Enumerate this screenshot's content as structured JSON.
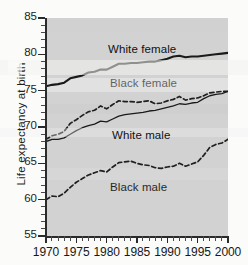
{
  "chart_data": {
    "type": "line",
    "title": "",
    "xlabel": "",
    "ylabel": "Life expectancy at birth",
    "xlim": [
      1970,
      2000
    ],
    "ylim": [
      55,
      85
    ],
    "grid": false,
    "legend_position": "inline-labels",
    "y_ticks": [
      55,
      60,
      65,
      70,
      75,
      80,
      85
    ],
    "y_tick_labels": [
      "55",
      "60",
      "65",
      "70",
      "75",
      "80",
      "85"
    ],
    "y_minor_tick_step": 1,
    "x_ticks": [
      1970,
      1975,
      1980,
      1985,
      1990,
      1995,
      2000
    ],
    "x_tick_labels": [
      "1970",
      "1975",
      "1980",
      "1985",
      "1990",
      "1995",
      "2000"
    ],
    "x_minor_tick_step": 1,
    "x": [
      1970,
      1971,
      1972,
      1973,
      1974,
      1975,
      1976,
      1977,
      1978,
      1979,
      1980,
      1981,
      1982,
      1983,
      1984,
      1985,
      1986,
      1987,
      1988,
      1989,
      1990,
      1991,
      1992,
      1993,
      1994,
      1995,
      1996,
      1997,
      1998,
      1999,
      2000
    ],
    "series": [
      {
        "name": "White female",
        "style": "solid",
        "width": 2.1,
        "color": "#1a1a1a",
        "values": [
          75.6,
          75.8,
          75.9,
          76.1,
          76.7,
          76.9,
          77.1,
          77.5,
          77.6,
          77.9,
          77.9,
          78.3,
          78.7,
          78.7,
          78.8,
          78.8,
          78.9,
          79.0,
          79.0,
          79.2,
          79.4,
          79.7,
          79.8,
          79.6,
          79.7,
          79.7,
          79.8,
          79.9,
          80.0,
          80.1,
          80.2
        ]
      },
      {
        "name": "Black female",
        "style": "dashed",
        "width": 1.7,
        "color": "#1f1f1f",
        "values": [
          68.3,
          68.8,
          69.0,
          69.4,
          70.5,
          71.0,
          71.6,
          72.1,
          72.3,
          72.9,
          72.5,
          73.1,
          73.6,
          73.5,
          73.5,
          73.4,
          73.5,
          73.6,
          73.2,
          73.3,
          73.6,
          73.8,
          74.2,
          73.7,
          73.9,
          74.0,
          74.3,
          74.7,
          74.8,
          74.9,
          74.9
        ]
      },
      {
        "name": "White male",
        "style": "solid",
        "width": 1.3,
        "color": "#1a1a1a",
        "values": [
          68.0,
          68.3,
          68.3,
          68.5,
          69.0,
          69.5,
          69.9,
          70.2,
          70.4,
          70.8,
          70.7,
          71.1,
          71.5,
          71.7,
          71.8,
          71.9,
          72.0,
          72.2,
          72.3,
          72.5,
          72.7,
          72.9,
          73.2,
          73.1,
          73.3,
          73.4,
          73.9,
          74.3,
          74.5,
          74.6,
          74.9
        ]
      },
      {
        "name": "Black male",
        "style": "dashed",
        "width": 1.7,
        "color": "#1f1f1f",
        "values": [
          60.0,
          60.5,
          60.4,
          60.9,
          61.7,
          62.4,
          62.9,
          63.4,
          63.7,
          64.0,
          63.8,
          64.5,
          65.1,
          65.2,
          65.3,
          65.0,
          64.8,
          64.7,
          64.4,
          64.3,
          64.5,
          64.6,
          65.0,
          64.6,
          64.9,
          65.2,
          66.1,
          67.2,
          67.6,
          67.8,
          68.3
        ]
      }
    ],
    "annotations": [
      {
        "text": "White female",
        "x": 1983,
        "y": 81.3
      },
      {
        "text": "Black female",
        "x": 1983,
        "y": 76.6
      },
      {
        "text": "White male",
        "x": 1984,
        "y": 69.4
      },
      {
        "text": "Black male",
        "x": 1983,
        "y": 62.0
      }
    ]
  }
}
